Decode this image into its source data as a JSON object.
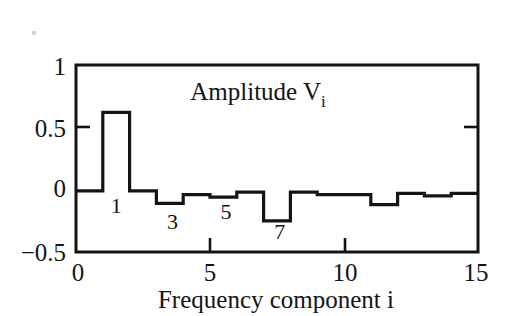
{
  "figure": {
    "name": "amplitude-spectrum-plot",
    "plot_title": "Amplitude V",
    "plot_title_sub": "i",
    "xlabel": "Frequency component i",
    "line_color": "#141414",
    "background_color": "#ffffff"
  },
  "axes": {
    "y_ticks": [
      {
        "label": "1",
        "value": 1
      },
      {
        "label": "0.5",
        "value": 0.5
      },
      {
        "label": "0",
        "value": 0
      },
      {
        "label": "−0.5",
        "value": -0.5
      }
    ],
    "x_ticks": [
      {
        "label": "0",
        "value": 0
      },
      {
        "label": "5",
        "value": 5
      },
      {
        "label": "10",
        "value": 10
      },
      {
        "label": "15",
        "value": 15
      }
    ],
    "xlim": [
      0,
      15
    ],
    "ylim": [
      -0.5,
      1
    ]
  },
  "annotations": [
    {
      "text": "1",
      "x": 1.5,
      "y": -0.12
    },
    {
      "text": "3",
      "x": 3.6,
      "y": -0.25
    },
    {
      "text": "5",
      "x": 5.6,
      "y": -0.17
    },
    {
      "text": "7",
      "x": 7.6,
      "y": -0.33
    }
  ],
  "chart_data": {
    "type": "bar",
    "xlabel": "Frequency component i",
    "ylabel": "",
    "xlim": [
      0,
      15
    ],
    "ylim": [
      -0.5,
      1
    ],
    "grid": false,
    "legend": "none",
    "style": "step / histogram outline (unfilled)",
    "categories": [
      0,
      1,
      2,
      3,
      4,
      5,
      6,
      7,
      8,
      9,
      10,
      11,
      12,
      13,
      14
    ],
    "values": [
      -0.01,
      0.62,
      -0.01,
      -0.11,
      -0.04,
      -0.06,
      -0.02,
      -0.25,
      -0.02,
      -0.04,
      -0.04,
      -0.12,
      -0.03,
      -0.05,
      -0.03
    ]
  }
}
